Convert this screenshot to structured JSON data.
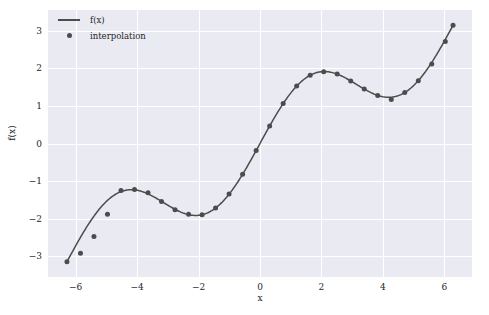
{
  "chart_data": {
    "type": "line",
    "title": "",
    "xlabel": "x",
    "ylabel": "f(x)",
    "xlim": [
      -6.9,
      6.9
    ],
    "ylim": [
      -3.55,
      3.55
    ],
    "xticks": [
      -6,
      -4,
      -2,
      0,
      2,
      4,
      6
    ],
    "xtick_labels": [
      "−6",
      "−4",
      "−2",
      "0",
      "2",
      "4",
      "6"
    ],
    "yticks": [
      -3,
      -2,
      -1,
      0,
      1,
      2,
      3
    ],
    "ytick_labels": [
      "−3",
      "−2",
      "−1",
      "0",
      "1",
      "2",
      "3"
    ],
    "grid": true,
    "grid_color": "#ffffff",
    "axes_facecolor": "#eaeaf2",
    "figure_facecolor": "#ffffff",
    "legend_position": "upper left",
    "series": [
      {
        "name": "f(x)",
        "kind": "line",
        "color": "#4c4c4c",
        "linewidth": 1.5,
        "x": [
          -6.2832,
          -6.0064,
          -5.7296,
          -5.4528,
          -5.176,
          -4.8992,
          -4.6224,
          -4.3456,
          -4.0688,
          -3.792,
          -3.5152,
          -3.2384,
          -2.9616,
          -2.6848,
          -2.408,
          -2.1312,
          -1.8544,
          -1.5776,
          -1.3008,
          -1.024,
          -0.7472,
          -0.4704,
          -0.1936,
          0.0832,
          0.36,
          0.6368,
          0.9136,
          1.1904,
          1.4672,
          1.744,
          2.0208,
          2.2976,
          2.5744,
          2.8512,
          3.128,
          3.4048,
          3.6816,
          3.9584,
          4.2352,
          4.512,
          4.7888,
          5.0656,
          5.3424,
          5.6192,
          5.896,
          6.1728,
          6.2832
        ],
        "y": [
          -3.1416,
          -3.2795,
          -3.4004,
          -3.4871,
          -3.5287,
          -3.5219,
          -3.4712,
          -3.3875,
          -3.0188,
          -2.5042,
          -2.1207,
          -1.7185,
          -1.6624,
          -1.3848,
          -1.2693,
          -1.2144,
          -1.2283,
          -1.2889,
          -1.6171,
          -1.3714,
          -1.5434,
          -1.6879,
          -1.7887,
          -1.8295,
          -1.8033,
          -1.7085,
          -1.0,
          -0.5,
          0.0,
          0.5,
          1.4,
          1.8,
          1.95,
          1.9,
          1.7,
          1.5,
          1.35,
          1.3,
          1.32,
          1.4,
          1.8,
          2.2,
          2.6,
          3.0,
          3.1416,
          3.1416,
          3.1416
        ]
      },
      {
        "name": "interpolation",
        "kind": "markers",
        "color": "#4c4c4c",
        "markersize": 5,
        "x": [
          -6.283,
          -5.843,
          -5.404,
          -4.964,
          -4.524,
          -4.084,
          -3.644,
          -3.205,
          -2.765,
          -2.325,
          -1.885,
          -1.446,
          -1.006,
          -0.566,
          -0.126,
          0.314,
          0.754,
          1.193,
          1.633,
          2.073,
          2.513,
          2.953,
          3.392,
          3.832,
          4.272,
          4.712,
          5.152,
          5.591,
          6.031,
          6.283
        ],
        "y": [
          -3.142,
          -2.921,
          -2.475,
          -1.88,
          -1.25,
          -1.225,
          -1.31,
          -1.544,
          -1.764,
          -1.879,
          -1.892,
          -1.715,
          -1.343,
          -0.819,
          -0.189,
          0.466,
          1.061,
          1.529,
          1.814,
          1.908,
          1.847,
          1.66,
          1.446,
          1.275,
          1.168,
          1.356,
          1.671,
          2.117,
          2.711,
          3.142
        ]
      }
    ]
  },
  "legend": {
    "entries": [
      {
        "label": "f(x)",
        "key": "line-key"
      },
      {
        "label": "interpolation",
        "key": "dot-key"
      }
    ]
  },
  "axis_titles": {
    "x": "x",
    "y": "f(x)"
  }
}
